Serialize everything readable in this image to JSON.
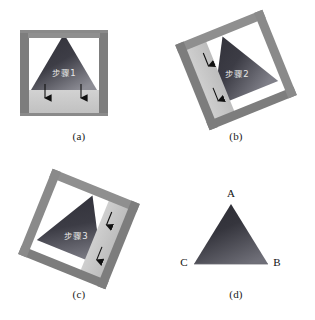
{
  "figure": {
    "title": "",
    "panels": [
      {
        "id": "a",
        "caption": "(a)",
        "step_text": "步骤1",
        "arrow_count": 2,
        "arrow_direction": "down",
        "frame_rotation_deg": 0,
        "description": "upright square frame with triangle inside and light bar at bottom"
      },
      {
        "id": "b",
        "caption": "(b)",
        "step_text": "步骤2",
        "arrow_count": 2,
        "arrow_direction": "up-left",
        "frame_rotation_deg": -22,
        "description": "rotated square frame with triangle inside and light bar on upper-left side"
      },
      {
        "id": "c",
        "caption": "(c)",
        "step_text": "步骤3",
        "arrow_count": 2,
        "arrow_direction": "up-right",
        "frame_rotation_deg": 22,
        "description": "rotated square frame with triangle inside and light bar on upper-right side"
      },
      {
        "id": "d",
        "caption": "(d)",
        "step_text": "",
        "arrow_count": 0,
        "arrow_direction": "none",
        "frame_rotation_deg": 0,
        "description": "final labeled triangle with vertices A, B, C",
        "vertices": [
          {
            "label": "A",
            "position": "apex-top"
          },
          {
            "label": "B",
            "position": "bottom-right"
          },
          {
            "label": "C",
            "position": "bottom-left"
          }
        ]
      }
    ]
  },
  "colors": {
    "background": "#ffffff",
    "frame_dark": "#7d7d7d",
    "frame_mid": "#8f8f8f",
    "bar_light": "#c9c9c9",
    "triangle_dark": "#3a3a42",
    "triangle_light": "#8b8b93",
    "arrow": "#101010",
    "text_label": "#e9e9e9",
    "caption": "#1a1a1a",
    "vertex_label": "#111111"
  }
}
